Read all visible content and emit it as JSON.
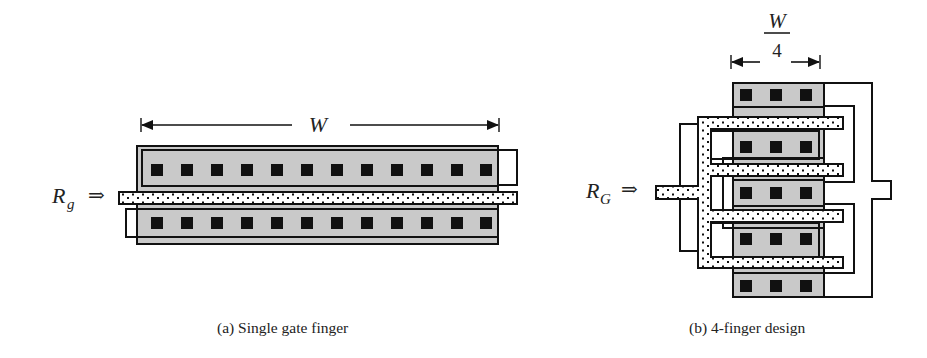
{
  "figure": {
    "panel_a": {
      "dimension_label": "W",
      "input_label_main": "R",
      "input_label_sub": "g",
      "input_arrow": "⇒",
      "caption": "(a)  Single gate finger",
      "contacts_per_row": 12,
      "rows": 2
    },
    "panel_b": {
      "dimension_label_numerator": "W",
      "dimension_label_denominator": "4",
      "input_label_main": "R",
      "input_label_sub": "G",
      "input_arrow": "⇒",
      "caption": "(b) 4-finger design",
      "fingers": 4,
      "contacts_per_row": 3,
      "rows": 5
    },
    "colors": {
      "active_fill": "#c9c9c9",
      "line": "#111111",
      "contact": "#111111",
      "poly_dots": "#111111",
      "background": "#ffffff"
    }
  }
}
